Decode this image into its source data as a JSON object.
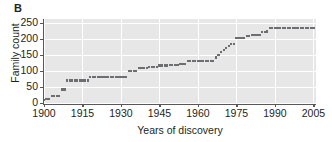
{
  "panel": {
    "letter": "B"
  },
  "chart_data": {
    "type": "scatter",
    "title": "",
    "xlabel": "Years of discovery",
    "ylabel": "Family count",
    "xlim": [
      1900,
      2006
    ],
    "ylim": [
      0,
      262
    ],
    "xticks": [
      1900,
      1915,
      1930,
      1945,
      1960,
      1975,
      1990,
      2005
    ],
    "xtick_labels": [
      "1900",
      "1915",
      "1930",
      "1945",
      "1960",
      "1975",
      "1990",
      "2005"
    ],
    "yticks": [
      0,
      50,
      100,
      150,
      200,
      250
    ],
    "ytick_labels": [
      "0",
      "50",
      "100",
      "150",
      "200",
      "250"
    ],
    "grid": true,
    "grid_color": "#ffffff",
    "plot_background": "#e7e7e7",
    "marker_color": "#6d6e71",
    "legend": null,
    "x": [
      1900,
      1901,
      1902,
      1903,
      1904,
      1905,
      1906,
      1907,
      1908,
      1909,
      1910,
      1911,
      1912,
      1913,
      1914,
      1915,
      1916,
      1917,
      1918,
      1919,
      1920,
      1921,
      1922,
      1923,
      1924,
      1925,
      1926,
      1927,
      1928,
      1929,
      1930,
      1931,
      1932,
      1933,
      1934,
      1935,
      1936,
      1937,
      1938,
      1939,
      1940,
      1941,
      1942,
      1943,
      1944,
      1945,
      1946,
      1947,
      1948,
      1949,
      1950,
      1951,
      1952,
      1953,
      1954,
      1955,
      1956,
      1957,
      1958,
      1959,
      1960,
      1961,
      1962,
      1963,
      1964,
      1965,
      1966,
      1967,
      1968,
      1969,
      1970,
      1971,
      1972,
      1973,
      1974,
      1975,
      1976,
      1977,
      1978,
      1979,
      1980,
      1981,
      1982,
      1983,
      1984,
      1985,
      1986,
      1987,
      1988,
      1989,
      1990,
      1991,
      1992,
      1993,
      1994,
      1995,
      1996,
      1997,
      1998,
      1999,
      2000,
      2001,
      2002,
      2003,
      2004,
      2005
    ],
    "y": [
      10,
      12,
      12,
      22,
      22,
      22,
      22,
      42,
      42,
      70,
      70,
      70,
      70,
      70,
      70,
      70,
      70,
      70,
      80,
      80,
      80,
      80,
      80,
      80,
      80,
      80,
      80,
      80,
      80,
      80,
      80,
      80,
      80,
      100,
      100,
      101,
      101,
      110,
      110,
      110,
      110,
      111,
      111,
      111,
      111,
      117,
      117,
      117,
      117,
      118,
      118,
      118,
      118,
      122,
      122,
      122,
      132,
      132,
      132,
      132,
      132,
      132,
      132,
      132,
      132,
      132,
      132,
      142,
      150,
      158,
      166,
      172,
      178,
      183,
      185,
      202,
      202,
      203,
      203,
      210,
      210,
      211,
      211,
      212,
      212,
      221,
      222,
      223,
      233,
      233,
      233,
      233,
      233,
      233,
      233,
      233,
      233,
      233,
      233,
      233,
      233,
      233,
      233,
      233,
      233,
      233
    ]
  }
}
